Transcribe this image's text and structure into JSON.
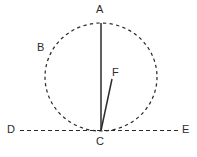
{
  "figure": {
    "background_color": "#ffffff",
    "stroke_color": "#2b2b2b",
    "label_color": "#2b2b2b",
    "circle": {
      "name": "dashed-circle",
      "style": "dashed",
      "center_x": 101,
      "center_y": 77,
      "radius_x": 56,
      "radius_y": 54
    },
    "lines": [
      {
        "name": "line-segment-ac",
        "from": "A",
        "to": "C",
        "style": "solid",
        "x1": 101,
        "y1": 23,
        "x2": 101,
        "y2": 130
      },
      {
        "name": "line-segment-cf",
        "from": "C",
        "to": "F",
        "style": "solid",
        "x1": 101,
        "y1": 130,
        "x2": 112,
        "y2": 79
      },
      {
        "name": "line-de",
        "from": "D",
        "to": "E",
        "style": "dashed",
        "x1": 20,
        "y1": 130,
        "x2": 178,
        "y2": 130
      }
    ],
    "points": [
      {
        "name": "point-label-a",
        "label": "A",
        "x": 96,
        "y": 4
      },
      {
        "name": "point-label-b",
        "label": "B",
        "x": 37,
        "y": 42
      },
      {
        "name": "point-label-f",
        "label": "F",
        "x": 112,
        "y": 67
      },
      {
        "name": "point-label-d",
        "label": "D",
        "x": 7,
        "y": 124
      },
      {
        "name": "point-label-e",
        "label": "E",
        "x": 182,
        "y": 124
      },
      {
        "name": "point-label-c",
        "label": "C",
        "x": 96,
        "y": 136
      }
    ]
  }
}
